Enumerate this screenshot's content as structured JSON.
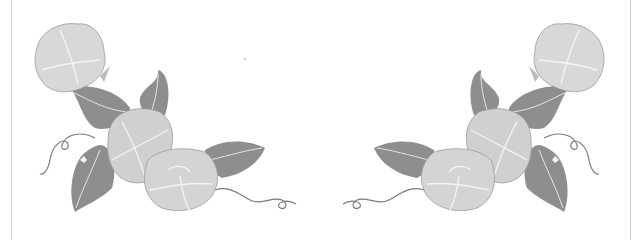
{
  "image": {
    "description": "Grayscale watercolor illustration of morning glory flowers with leaves and curling tendrils, arranged as two mirrored corner decorations",
    "background": "#ffffff",
    "border_color": "#cfcfcf",
    "palette": {
      "flower_fill": "#d8d8d8",
      "flower_edge": "#9a9a9a",
      "flower_highlight": "#f4f4f4",
      "leaf_fill": "#8e8e8e",
      "leaf_vein": "#e6e6e6",
      "tendril": "#7a7a7a"
    },
    "groups": [
      {
        "name": "left-corner-spray",
        "flowers": 3,
        "leaves": 5,
        "tendrils": 2
      },
      {
        "name": "right-corner-spray",
        "flowers": 3,
        "leaves": 5,
        "tendrils": 2,
        "mirrored": true
      }
    ]
  }
}
